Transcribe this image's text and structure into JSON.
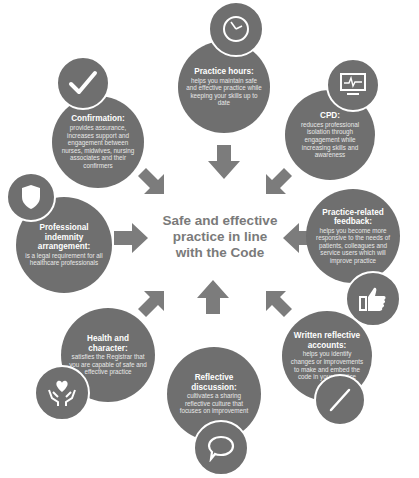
{
  "center": {
    "line1": "Safe and effective",
    "line2": "practice in line",
    "line3": "with the Code"
  },
  "nodes": [
    {
      "id": "practice-hours",
      "title": "Practice hours:",
      "body": "helps you maintain safe and effective practice while keeping your skills up to date",
      "icon": "clock-icon"
    },
    {
      "id": "confirmation",
      "title": "Confirmation:",
      "body": "provides assurance, increases support and engagement between nurses, midwives, nursing associates and their confirmers",
      "icon": "checkmark-icon"
    },
    {
      "id": "cpd",
      "title": "CPD:",
      "body": "reduces professional isolation through engagement while increasing skills and awareness",
      "icon": "monitor-icon"
    },
    {
      "id": "professional-indemnity",
      "title": "Professional indemnity arrangement:",
      "body": "is a legal requirement for all healthcare professionals",
      "icon": "shield-icon"
    },
    {
      "id": "practice-related-feedback",
      "title": "Practice-related feedback:",
      "body": "helps you become more responsive to the needs of patients, colleagues and service users which will improve practice",
      "icon": "thumbs-up-icon"
    },
    {
      "id": "health-and-character",
      "title": "Health and character:",
      "body": "satisfies the Registrar that you are capable of safe and effective practice",
      "icon": "heart-hands-icon"
    },
    {
      "id": "reflective-discussion",
      "title": "Reflective discussion:",
      "body": "cultivates a sharing reflective culture that focuses on improvement",
      "icon": "speech-bubble-icon"
    },
    {
      "id": "written-reflective-accounts",
      "title": "Written reflective accounts:",
      "body": "helps you identify changes or improvements to make and embed the code in your practice",
      "icon": "pen-icon"
    }
  ],
  "colors": {
    "circle": "#6f6f6f",
    "arrow": "#7c7c7c",
    "center_text": "#7a7a7a",
    "background": "#ffffff"
  }
}
